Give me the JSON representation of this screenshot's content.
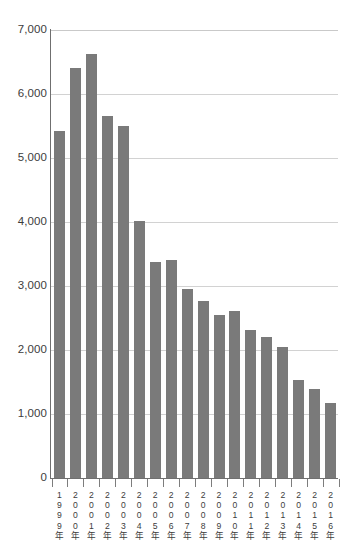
{
  "chart_data": {
    "type": "bar",
    "title": "",
    "xlabel": "",
    "ylabel": "",
    "ylim": [
      0,
      7000
    ],
    "grid": true,
    "legend": null,
    "categories": [
      "1999年",
      "2000年",
      "2001年",
      "2002年",
      "2003年",
      "2004年",
      "2005年",
      "2006年",
      "2007年",
      "2008年",
      "2009年",
      "2010年",
      "2011年",
      "2012年",
      "2013年",
      "2014年",
      "2015年",
      "2016年"
    ],
    "values": [
      5420,
      6400,
      6620,
      5650,
      5500,
      4020,
      3370,
      3410,
      2950,
      2760,
      2540,
      2610,
      2320,
      2200,
      2050,
      1530,
      1390,
      1170
    ],
    "ytick_labels": [
      "7,000",
      "6,000",
      "5,000",
      "4,000",
      "3,000",
      "2,000",
      "1,000",
      "0"
    ],
    "ytick_values": [
      7000,
      6000,
      5000,
      4000,
      3000,
      2000,
      1000,
      0
    ],
    "colors": {
      "bar": "#7a7a7a",
      "gridline": "#d2d2d2",
      "axis": "#6f6f6f",
      "tick_label": "#3c3c3c",
      "background": "#ffffff"
    }
  }
}
